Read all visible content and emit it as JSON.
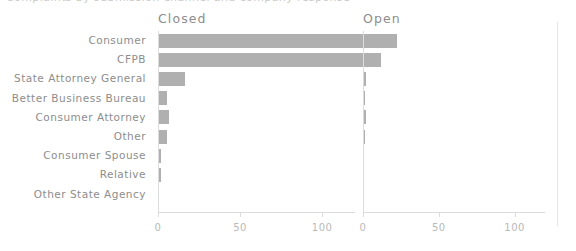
{
  "chart_data": {
    "type": "bar",
    "orientation": "horizontal",
    "title": "",
    "xlabel": "",
    "ylabel": "",
    "grid": false,
    "legend_position": "none",
    "facet_layout": "1x2",
    "bar_color": "#b0b0b0",
    "text_color": "#8d8d8d",
    "tick_color": "#b9b9b9",
    "axis_color": "#dcdcdc",
    "xlim": [
      0,
      120
    ],
    "xticks": [
      0,
      50,
      100
    ],
    "xticklabels": [
      "0",
      "50",
      "100"
    ],
    "categories": [
      "Consumer",
      "CFPB",
      "State Attorney General",
      "Better Business Bureau",
      "Consumer Attorney",
      "Other",
      "Consumer Spouse",
      "Relative",
      "Other State Agency"
    ],
    "facets": [
      {
        "name": "Closed",
        "values": [
          132,
          131,
          16,
          5,
          6,
          5,
          1,
          1,
          0
        ]
      },
      {
        "name": "Open",
        "values": [
          22,
          11,
          1,
          0.5,
          1,
          0.5,
          0,
          0,
          0
        ]
      }
    ]
  },
  "title_sliver": "Complaints by submission channel and company response"
}
